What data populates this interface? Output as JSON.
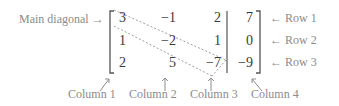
{
  "labels": {
    "main_diagonal": "Main diagonal",
    "rows": [
      "Row 1",
      "Row 2",
      "Row 3"
    ],
    "columns": [
      "Column 1",
      "Column 2",
      "Column 3",
      "Column 4"
    ],
    "arrow_right": "→",
    "arrow_left": "←"
  },
  "matrix": {
    "rows": [
      [
        "3",
        "−1",
        "2",
        "7"
      ],
      [
        "1",
        "−2",
        "1",
        "0"
      ],
      [
        "2",
        "5",
        "−7",
        "−9"
      ]
    ]
  },
  "colors": {
    "label": "#8c8c8c",
    "number": "#3a3a3a",
    "bracket": "#555555",
    "diagonal": "#a0a0a0"
  }
}
